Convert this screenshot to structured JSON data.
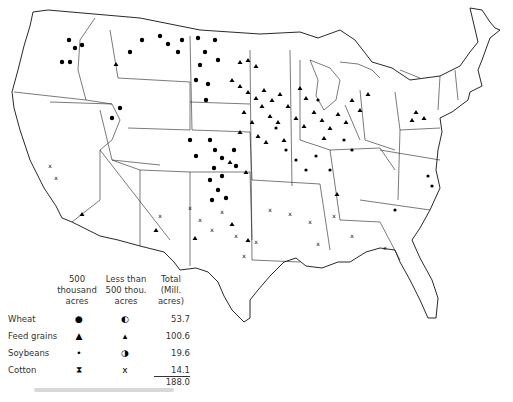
{
  "figure": {
    "caption_text": "(illegible)"
  },
  "legend": {
    "headers": {
      "large": [
        "500",
        "thousand",
        "acres"
      ],
      "small": [
        "Less than",
        "500 thou.",
        "acres"
      ],
      "total": [
        "Total",
        "(Mill.",
        "acres)"
      ]
    },
    "rows": [
      {
        "crop": "Wheat",
        "symbol_large": "●",
        "symbol_small": "◐",
        "total": "53.7",
        "symbol_name": "filled-circle"
      },
      {
        "crop": "Feed grains",
        "symbol_large": "▲",
        "symbol_small": "▴",
        "total": "100.6",
        "symbol_name": "filled-triangle"
      },
      {
        "crop": "Soybeans",
        "symbol_large": "•",
        "symbol_small": "◑",
        "total": "19.6",
        "symbol_name": "small-circle"
      },
      {
        "crop": "Cotton",
        "symbol_large": "⧗",
        "symbol_small": "x",
        "total": "14.1",
        "symbol_name": "hourglass"
      }
    ],
    "grand_total": "188.0"
  },
  "map": {
    "region": "Conterminous United States",
    "line_color": "#111111",
    "symbol_color": "#000000",
    "background": "#ffffff"
  }
}
